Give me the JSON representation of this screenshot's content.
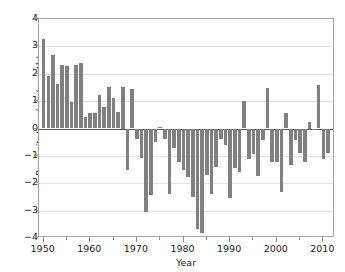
{
  "chart_data": {
    "type": "bar",
    "title": "",
    "xlabel": "Year",
    "ylabel": "Precipitation (cm/month)",
    "xlim": [
      1949.0,
      2012.5
    ],
    "ylim": [
      -4,
      4
    ],
    "grid": true,
    "legend": null,
    "bar_color": "#808080",
    "yticks": [
      4,
      3,
      2,
      1,
      0,
      -1,
      -2,
      -3,
      -4
    ],
    "ytick_labels": [
      "4",
      "3",
      "2",
      "1",
      "0",
      "−1",
      "−2",
      "−3",
      "−4"
    ],
    "xticks": [
      1950,
      1960,
      1970,
      1980,
      1990,
      2000,
      2010
    ],
    "xtick_labels": [
      "1950",
      "1960",
      "1970",
      "1980",
      "1990",
      "2000",
      "2010"
    ],
    "categories": [
      1950,
      1951,
      1952,
      1953,
      1954,
      1955,
      1956,
      1957,
      1958,
      1959,
      1960,
      1961,
      1962,
      1963,
      1964,
      1965,
      1966,
      1967,
      1968,
      1969,
      1970,
      1971,
      1972,
      1973,
      1974,
      1975,
      1976,
      1977,
      1978,
      1979,
      1980,
      1981,
      1982,
      1983,
      1984,
      1985,
      1986,
      1987,
      1988,
      1989,
      1990,
      1991,
      1992,
      1993,
      1994,
      1995,
      1996,
      1997,
      1998,
      1999,
      2000,
      2001,
      2002,
      2003,
      2004,
      2005,
      2006,
      2007,
      2008,
      2009,
      2010,
      2011
    ],
    "values": [
      3.28,
      1.9,
      2.67,
      1.64,
      2.31,
      2.3,
      0.96,
      2.33,
      2.4,
      0.42,
      0.55,
      0.57,
      1.22,
      0.8,
      1.53,
      1.13,
      0.62,
      1.5,
      -1.52,
      1.46,
      -0.38,
      -1.08,
      -3.05,
      -2.44,
      -0.48,
      0.05,
      -0.4,
      -2.38,
      -0.72,
      -1.24,
      -1.5,
      -1.78,
      -2.52,
      -3.68,
      -3.83,
      -1.7,
      -2.38,
      -1.4,
      -0.38,
      -0.62,
      -2.55,
      -1.45,
      -1.6,
      1.01,
      -1.12,
      -0.92,
      -1.72,
      -0.43,
      1.47,
      -1.23,
      -1.24,
      -2.32,
      0.56,
      -1.34,
      -0.42,
      -0.9,
      -1.22,
      0.25,
      -0.05,
      1.6,
      -1.12,
      -0.9
    ]
  }
}
